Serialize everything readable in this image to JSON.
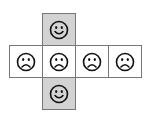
{
  "diagram": {
    "type": "cube-net",
    "colors": {
      "shaded": "#d3d3d3",
      "plain": "#ffffff",
      "border": "#777777",
      "face": "#111111"
    },
    "cells": [
      {
        "id": "top",
        "x": 42,
        "y": 13,
        "face": "smiley",
        "shaded": true
      },
      {
        "id": "left",
        "x": 9,
        "y": 45,
        "face": "frowny",
        "shaded": false
      },
      {
        "id": "center",
        "x": 42,
        "y": 45,
        "face": "frowny",
        "shaded": false
      },
      {
        "id": "right1",
        "x": 75,
        "y": 45,
        "face": "frowny",
        "shaded": false
      },
      {
        "id": "right2",
        "x": 108,
        "y": 45,
        "face": "frowny",
        "shaded": false
      },
      {
        "id": "bottom",
        "x": 42,
        "y": 77,
        "face": "smiley",
        "shaded": true
      }
    ]
  }
}
